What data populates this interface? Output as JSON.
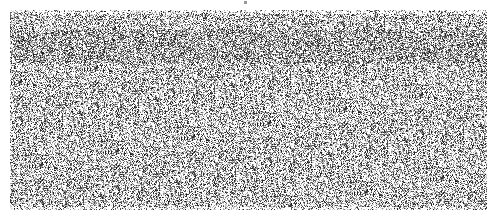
{
  "image": {
    "description": "Grayscale speckle / stipple noise texture field",
    "background_color": "#ffffff",
    "field": {
      "x": 10,
      "y": 10,
      "width": 477,
      "height": 200
    },
    "dark_band": {
      "y_start": 30,
      "y_end": 62
    },
    "ink_color": "#1a1a1a",
    "top_marker": {
      "x": 244,
      "y": 1
    }
  }
}
